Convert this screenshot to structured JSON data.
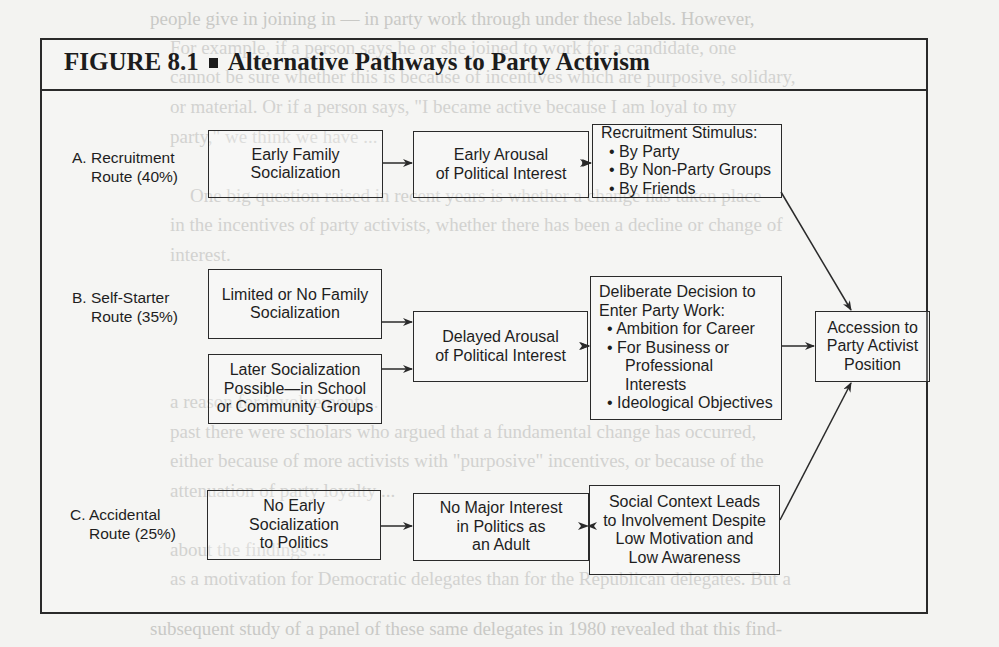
{
  "figure": {
    "label": "FIGURE 8.1",
    "separator": "■",
    "title": "Alternative Pathways to Party Activism"
  },
  "routes": {
    "a": {
      "line1": "A. Recruitment",
      "line2": "Route (40%)"
    },
    "b": {
      "line1": "B. Self-Starter",
      "line2": "Route (35%)"
    },
    "c": {
      "line1": "C. Accidental",
      "line2": "Route (25%)"
    }
  },
  "boxes": {
    "early_family": [
      "Early Family",
      "Socialization"
    ],
    "early_arousal": [
      "Early Arousal",
      "of Political Interest"
    ],
    "recruitment_stimulus": {
      "heading": "Recruitment Stimulus:",
      "items": [
        "• By Party",
        "• By Non-Party Groups",
        "• By Friends"
      ]
    },
    "limited_family": [
      "Limited or No Family",
      "Socialization"
    ],
    "later_socialization": [
      "Later Socialization",
      "Possible—in School",
      "or Community Groups"
    ],
    "delayed_arousal": [
      "Delayed Arousal",
      "of Political Interest"
    ],
    "deliberate_decision": {
      "heading1": "Deliberate Decision to",
      "heading2": "Enter Party Work:",
      "items": [
        "• Ambition for Career",
        "• For Business or",
        "Professional",
        "Interests",
        "• Ideological Objectives"
      ]
    },
    "accession": [
      "Accession to",
      "Party Activist",
      "Position"
    ],
    "no_early": [
      "No Early",
      "Socialization",
      "to Politics"
    ],
    "no_major": [
      "No Major Interest",
      "in Politics as",
      "an Adult"
    ],
    "social_context": [
      "Social Context Leads",
      "to Involvement Despite",
      "Low Motivation and",
      "Low Awareness"
    ]
  },
  "background_bleed_text": [
    "people give in joining in — in party work through under these labels. However,",
    "For example, if a person says he or she joined to work for a candidate, one",
    "cannot be sure whether this is because of incentives which are purposive, solidary,",
    "or material. Or if a person says, \"I became active because I am loyal to my",
    "party,\" we think we have ...",
    "One big question raised in recent years is whether a change has taken place",
    "in the incentives of party activists, whether there has been a decline or change of",
    "interest.",
    "a reason for involvement ...",
    "past there were scholars who argued that a fundamental change has occurred,",
    "either because of more activists with \"purposive\" incentives, or because of the",
    "attenuation of party loyalty ...",
    "about the findings ...",
    "as a motivation for Democratic delegates than for the Republican delegates. But a",
    "subsequent study of a panel of these same delegates in 1980 revealed that this find-"
  ],
  "colors": {
    "ink": "#1e1e1e",
    "frame": "#2a2a2a",
    "paper": "#f3f3f1",
    "bleed": "#c9c9c6"
  }
}
